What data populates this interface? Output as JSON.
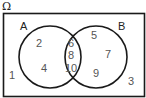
{
  "diagram": {
    "type": "venn",
    "universe_label": "Ω",
    "set_a_label": "A",
    "set_b_label": "B",
    "only_a": [
      "2",
      "4"
    ],
    "intersection": [
      "6",
      "8",
      "10"
    ],
    "only_b": [
      "5",
      "7",
      "9"
    ],
    "outside": [
      "1",
      "3"
    ],
    "colors": {
      "line": "#1a1a1a",
      "numbers": "#555555",
      "background": "#ffffff"
    }
  }
}
